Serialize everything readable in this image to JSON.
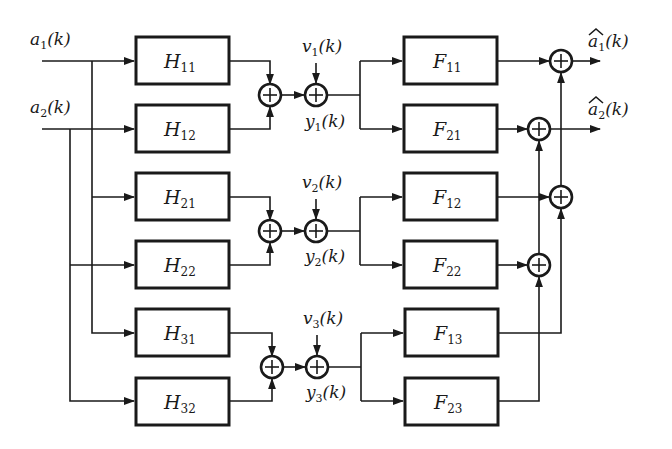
{
  "diagram": {
    "type": "block-diagram",
    "inputs": [
      {
        "id": "a1",
        "symbol": "a",
        "subscript": "1",
        "arg": "(k)"
      },
      {
        "id": "a2",
        "symbol": "a",
        "subscript": "2",
        "arg": "(k)"
      }
    ],
    "outputs": [
      {
        "id": "a1hat",
        "symbol": "a",
        "subscript": "1",
        "arg": "(k)",
        "hat": true
      },
      {
        "id": "a2hat",
        "symbol": "a",
        "subscript": "2",
        "arg": "(k)",
        "hat": true
      }
    ],
    "channels": [
      {
        "id": "1",
        "tx_filters": [
          {
            "symbol": "H",
            "subscript": "11",
            "input": "a1"
          },
          {
            "symbol": "H",
            "subscript": "12",
            "input": "a2"
          }
        ],
        "noise": {
          "symbol": "v",
          "subscript": "1",
          "arg": "(k)"
        },
        "output": {
          "symbol": "y",
          "subscript": "1",
          "arg": "(k)"
        },
        "rx_filters": [
          {
            "symbol": "F",
            "subscript": "11",
            "output": "a1hat"
          },
          {
            "symbol": "F",
            "subscript": "21",
            "output": "a2hat"
          }
        ]
      },
      {
        "id": "2",
        "tx_filters": [
          {
            "symbol": "H",
            "subscript": "21",
            "input": "a1"
          },
          {
            "symbol": "H",
            "subscript": "22",
            "input": "a2"
          }
        ],
        "noise": {
          "symbol": "v",
          "subscript": "2",
          "arg": "(k)"
        },
        "output": {
          "symbol": "y",
          "subscript": "2",
          "arg": "(k)"
        },
        "rx_filters": [
          {
            "symbol": "F",
            "subscript": "12",
            "output": "a1hat"
          },
          {
            "symbol": "F",
            "subscript": "22",
            "output": "a2hat"
          }
        ]
      },
      {
        "id": "3",
        "tx_filters": [
          {
            "symbol": "H",
            "subscript": "31",
            "input": "a1"
          },
          {
            "symbol": "H",
            "subscript": "32",
            "input": "a2"
          }
        ],
        "noise": {
          "symbol": "v",
          "subscript": "3",
          "arg": "(k)"
        },
        "output": {
          "symbol": "y",
          "subscript": "3",
          "arg": "(k)"
        },
        "rx_filters": [
          {
            "symbol": "F",
            "subscript": "13",
            "output": "a1hat"
          },
          {
            "symbol": "F",
            "subscript": "23",
            "output": "a2hat"
          }
        ]
      }
    ],
    "summer_symbol": "+",
    "colors": {
      "ink": "#1a1a1a",
      "background": "#ffffff"
    }
  }
}
